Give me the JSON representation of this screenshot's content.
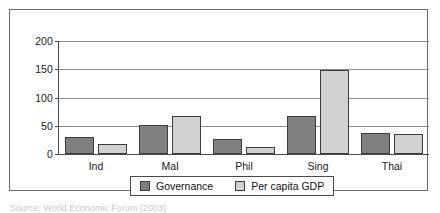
{
  "chart_data": {
    "type": "bar",
    "title": "",
    "xlabel": "",
    "ylabel": "",
    "categories": [
      "Ind",
      "Mal",
      "Phil",
      "Sing",
      "Thai"
    ],
    "series": [
      {
        "name": "Governance",
        "color": "#808080",
        "values": [
          31,
          51,
          26,
          68,
          37
        ]
      },
      {
        "name": "Per capita GDP",
        "color": "#d2d2d2",
        "values": [
          17,
          67,
          13,
          148,
          35
        ]
      }
    ],
    "ylim": [
      0,
      200
    ],
    "yticks": [
      0,
      50,
      100,
      150,
      200
    ],
    "ytick_labels": [
      "0",
      "50",
      "100",
      "150",
      "200"
    ],
    "grid": true,
    "legend_position": "bottom-center"
  },
  "legend": {
    "entries": [
      {
        "label": "Governance"
      },
      {
        "label": "Per capita GDP"
      }
    ]
  },
  "caption": {
    "text": "Source: World Economic Forum (2003)"
  }
}
